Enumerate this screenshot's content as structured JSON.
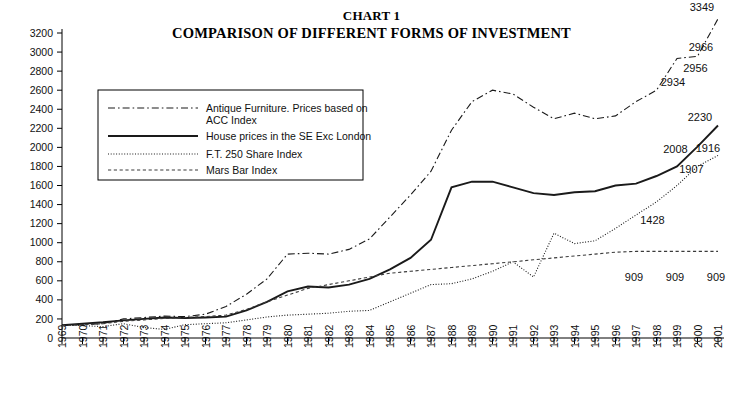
{
  "title": {
    "line1": "CHART 1",
    "line2": "COMPARISON OF DIFFERENT FORMS OF INVESTMENT"
  },
  "chart_data": {
    "type": "line",
    "xlabel": "",
    "ylabel": "",
    "ylim": [
      0,
      3200
    ],
    "ytick_step": 200,
    "grid": false,
    "legend_position": "upper-left-inside",
    "categories": [
      1969,
      1970,
      1971,
      1972,
      1973,
      1974,
      1975,
      1976,
      1977,
      1978,
      1979,
      1980,
      1981,
      1982,
      1983,
      1984,
      1985,
      1986,
      1987,
      1988,
      1989,
      1990,
      1991,
      1992,
      1993,
      1994,
      1995,
      1996,
      1997,
      1998,
      1999,
      2000,
      2001
    ],
    "yticks": [
      0,
      200,
      400,
      600,
      800,
      1000,
      1200,
      1400,
      1600,
      1800,
      2000,
      2200,
      2400,
      2600,
      2800,
      3000,
      3200
    ],
    "series": [
      {
        "name": "Antique Furniture. Prices based on ACC Index",
        "style": "dash-dot",
        "values": [
          130,
          140,
          150,
          200,
          215,
          230,
          225,
          250,
          330,
          460,
          620,
          880,
          890,
          880,
          930,
          1040,
          1270,
          1500,
          1750,
          2180,
          2480,
          2600,
          2560,
          2420,
          2300,
          2360,
          2300,
          2330,
          2480,
          2600,
          2934,
          2956,
          3349
        ]
      },
      {
        "name": "House prices in the SE Exc London",
        "style": "solid",
        "values": [
          135,
          150,
          165,
          185,
          200,
          215,
          210,
          215,
          225,
          290,
          380,
          490,
          540,
          530,
          560,
          620,
          720,
          840,
          1030,
          1580,
          1640,
          1640,
          1580,
          1520,
          1500,
          1530,
          1540,
          1600,
          1620,
          1700,
          1800,
          2008,
          2230
        ]
      },
      {
        "name": "F.T. 250 Share Index",
        "style": "dotted",
        "values": [
          140,
          130,
          120,
          150,
          110,
          90,
          140,
          150,
          160,
          190,
          220,
          240,
          250,
          260,
          280,
          290,
          380,
          470,
          560,
          570,
          620,
          700,
          800,
          640,
          1100,
          990,
          1020,
          1150,
          1290,
          1428,
          1600,
          1800,
          1916
        ]
      },
      {
        "name": "Mars Bar Index",
        "style": "dashed",
        "values": [
          130,
          140,
          150,
          175,
          190,
          205,
          215,
          225,
          240,
          300,
          380,
          450,
          520,
          560,
          600,
          640,
          680,
          700,
          720,
          740,
          760,
          780,
          800,
          820,
          840,
          860,
          880,
          900,
          909,
          909,
          909,
          909,
          909
        ]
      }
    ],
    "annotations": [
      {
        "label": "3349",
        "series": "Antique Furniture. Prices based on ACC Index",
        "x": 2001,
        "value": 3349
      },
      {
        "label": "2966",
        "series": "House prices in the SE Exc London",
        "x": 2001,
        "value": 2966
      },
      {
        "label": "2956",
        "series": "Antique Furniture. Prices based on ACC Index",
        "x": 2000,
        "value": 2956
      },
      {
        "label": "2934",
        "series": "Antique Furniture. Prices based on ACC Index",
        "x": 1999,
        "value": 2934
      },
      {
        "label": "2230",
        "series": "House prices in the SE Exc London",
        "x": 2001,
        "value": 2230
      },
      {
        "label": "2008",
        "series": "House prices in the SE Exc London",
        "x": 2000,
        "value": 2008
      },
      {
        "label": "1916",
        "series": "F.T. 250 Share Index",
        "x": 2001,
        "value": 1916
      },
      {
        "label": "1907",
        "series": "F.T. 250 Share Index",
        "x": 2000,
        "value": 1907
      },
      {
        "label": "1428",
        "series": "F.T. 250 Share Index",
        "x": 1998,
        "value": 1428
      },
      {
        "label": "909",
        "series": "Mars Bar Index",
        "x": 1997,
        "value": 909
      },
      {
        "label": "909",
        "series": "Mars Bar Index",
        "x": 1999,
        "value": 909
      },
      {
        "label": "909",
        "series": "Mars Bar Index",
        "x": 2001,
        "value": 909
      }
    ]
  },
  "legend": {
    "items": [
      {
        "label": "Antique Furniture. Prices based on",
        "label2": "ACC Index",
        "style": "dash-dot"
      },
      {
        "label": "House prices in the SE Exc London",
        "label2": "",
        "style": "solid"
      },
      {
        "label": "F.T. 250 Share Index",
        "label2": "",
        "style": "dotted"
      },
      {
        "label": "Mars Bar Index",
        "label2": "",
        "style": "dashed"
      }
    ]
  }
}
